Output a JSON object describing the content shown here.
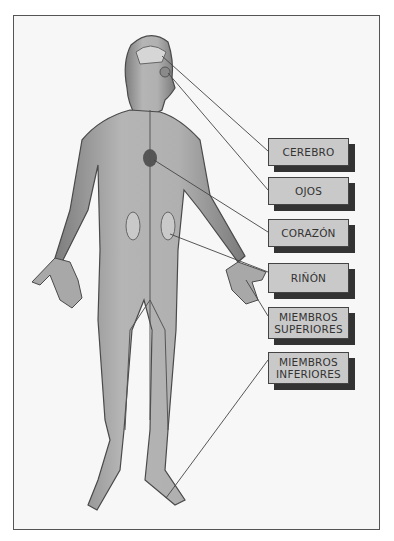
{
  "diagram": {
    "type": "anatomical-figure",
    "labels": [
      {
        "id": "cerebro",
        "lines": [
          "CEREBRO"
        ]
      },
      {
        "id": "ojos",
        "lines": [
          "OJOS"
        ]
      },
      {
        "id": "corazon",
        "lines": [
          "CORAZÓN"
        ]
      },
      {
        "id": "rinon",
        "lines": [
          "RIÑÓN"
        ]
      },
      {
        "id": "miembros-superiores",
        "lines": [
          "MIEMBROS",
          "SUPERIORES"
        ]
      },
      {
        "id": "miembros-inferiores",
        "lines": [
          "MIEMBROS",
          "INFERIORES"
        ]
      }
    ],
    "colors": {
      "body": "#a6a6a6",
      "outline": "#555555",
      "label_bg": "#c9c9c9",
      "shadow": "#333333"
    }
  }
}
